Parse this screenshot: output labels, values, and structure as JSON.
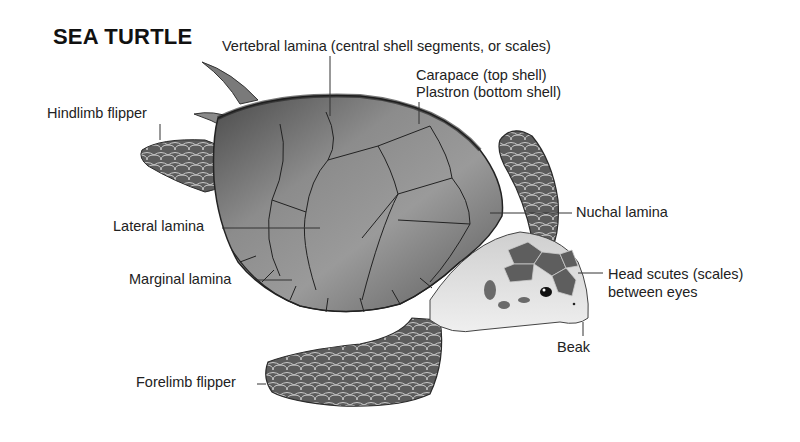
{
  "title": "SEA TURTLE",
  "labels": {
    "vertebral": "Vertebral lamina (central shell segments, or scales)",
    "carapace": "Carapace (top shell)",
    "plastron": "Plastron (bottom shell)",
    "hindlimb": "Hindlimb flipper",
    "lateral": "Lateral lamina",
    "nuchal": "Nuchal lamina",
    "marginal": "Marginal lamina",
    "head_scutes_1": "Head scutes (scales)",
    "head_scutes_2": "between eyes",
    "beak": "Beak",
    "forelimb": "Forelimb flipper"
  },
  "colors": {
    "shell_dark": "#3a3a3a",
    "shell_mid": "#7a7a7a",
    "shell_light": "#b8b8b8",
    "skin_light": "#dcdcdc",
    "scute": "#5e5e5e",
    "leader_line": "#333333"
  }
}
